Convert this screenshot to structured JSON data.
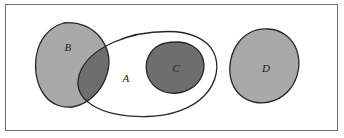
{
  "figure": {
    "type": "euler-venn-diagram",
    "caption": "",
    "background_color": "#ffffff",
    "frame": {
      "border_color": "#6f6f6f",
      "border_width": 1,
      "x": 5,
      "y": 4,
      "width": 333,
      "height": 127
    },
    "palette": {
      "light_gray_fill": "#a9a9a9",
      "dark_gray_fill": "#6e6e6e",
      "outline_stroke": "#262626",
      "white_fill": "#ffffff",
      "label_color": "#1a1a1a"
    },
    "sets": [
      {
        "id": "A",
        "label": "A",
        "fill": "none",
        "fill_name": "white",
        "stroke": "#262626",
        "stroke_width": 1.3,
        "label_x": 126,
        "label_y": 79,
        "description": "large unfilled rounded outline containing C and overlapping B"
      },
      {
        "id": "B",
        "label": "B",
        "fill": "#a9a9a9",
        "fill_name": "light-gray",
        "stroke": "#262626",
        "stroke_width": 1.3,
        "label_x": 68,
        "label_y": 48,
        "description": "light gray blob on the left, partially overlapping A"
      },
      {
        "id": "C",
        "label": "C",
        "fill": "#6e6e6e",
        "fill_name": "dark-gray",
        "stroke": "#262626",
        "stroke_width": 1.3,
        "label_x": 176,
        "label_y": 69,
        "description": "dark gray blob entirely inside A"
      },
      {
        "id": "D",
        "label": "D",
        "fill": "#a9a9a9",
        "fill_name": "light-gray",
        "stroke": "#262626",
        "stroke_width": 1.3,
        "label_x": 266,
        "label_y": 69,
        "description": "light gray blob on the right, disjoint from A, B and C"
      }
    ],
    "regions": [
      {
        "id": "A-intersect-B",
        "label": "",
        "fill": "#6e6e6e",
        "fill_name": "dark-gray",
        "description": "overlap of A and B shaded dark gray"
      }
    ],
    "relations": [
      "C is a subset of A",
      "A and B overlap",
      "D is disjoint from A, B and C"
    ]
  }
}
